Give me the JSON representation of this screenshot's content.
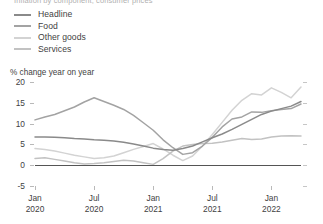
{
  "title": "Inflation by component, consumer prices",
  "legend": {
    "position": "top-left",
    "items": [
      {
        "label": "Headline",
        "color": "#8a8a8a"
      },
      {
        "label": "Food",
        "color": "#a3a3a3"
      },
      {
        "label": "Other goods",
        "color": "#d3d3d3"
      },
      {
        "label": "Services",
        "color": "#c2c2c2"
      }
    ]
  },
  "axis_caption": "% change year on year",
  "colors": {
    "axis": "#b9b9b9",
    "zero_line": "#555555",
    "text": "#3f3f3f",
    "background": "#ffffff"
  },
  "chart_data": {
    "type": "line",
    "title": "Inflation by component, consumer prices",
    "subtitle": "",
    "xlabel": "",
    "ylabel": "% change year on year",
    "ylim": [
      -5,
      20
    ],
    "yticks": [
      20,
      15,
      10,
      5,
      0,
      -5
    ],
    "ytick_labels": [
      "20",
      "15",
      "10",
      "5",
      "0",
      "-5"
    ],
    "grid": false,
    "legend_position": "top-left",
    "x": [
      "Jan 2020",
      "Feb 2020",
      "Mar 2020",
      "Apr 2020",
      "May 2020",
      "Jun 2020",
      "Jul 2020",
      "Aug 2020",
      "Sep 2020",
      "Oct 2020",
      "Nov 2020",
      "Dec 2020",
      "Jan 2021",
      "Feb 2021",
      "Mar 2021",
      "Apr 2021",
      "May 2021",
      "Jun 2021",
      "Jul 2021",
      "Aug 2021",
      "Sep 2021",
      "Oct 2021",
      "Nov 2021",
      "Dec 2021",
      "Jan 2022",
      "Feb 2022",
      "Mar 2022",
      "Apr 2022"
    ],
    "xticks": [
      "Jan 2020",
      "Jul 2020",
      "Jan 2021",
      "Jul 2021",
      "Jan 2022"
    ],
    "xtick_labels": [
      {
        "month": "Jan",
        "year": "2020"
      },
      {
        "month": "Jul",
        "year": "2020"
      },
      {
        "month": "Jan",
        "year": "2021"
      },
      {
        "month": "Jul",
        "year": "2021"
      },
      {
        "month": "Jan",
        "year": "2022"
      }
    ],
    "series": [
      {
        "name": "Headline",
        "color": "#8a8a8a",
        "values": [
          6.8,
          6.8,
          6.7,
          6.6,
          6.4,
          6.3,
          6.1,
          6.0,
          5.8,
          5.5,
          5.1,
          4.6,
          4.1,
          3.8,
          3.6,
          4.0,
          4.6,
          5.6,
          6.6,
          7.5,
          8.6,
          9.8,
          11.0,
          12.2,
          13.0,
          13.6,
          14.2,
          15.3
        ]
      },
      {
        "name": "Food",
        "color": "#a3a3a3",
        "values": [
          10.9,
          11.6,
          12.2,
          13.1,
          14.0,
          15.2,
          16.2,
          15.3,
          14.4,
          13.4,
          12.0,
          10.2,
          8.4,
          6.1,
          4.2,
          2.6,
          3.0,
          4.6,
          6.7,
          9.2,
          11.1,
          11.6,
          12.8,
          12.7,
          13.1,
          13.4,
          13.6,
          14.7
        ]
      },
      {
        "name": "Other goods",
        "color": "#d3d3d3",
        "values": [
          4.0,
          3.8,
          3.4,
          2.9,
          2.4,
          2.0,
          1.6,
          1.8,
          2.2,
          3.0,
          3.8,
          4.5,
          5.2,
          3.9,
          2.4,
          1.1,
          2.2,
          4.6,
          7.4,
          10.3,
          13.2,
          15.6,
          17.2,
          16.9,
          18.6,
          17.5,
          16.2,
          18.8
        ]
      },
      {
        "name": "Services",
        "color": "#c2c2c2",
        "values": [
          1.6,
          1.8,
          1.4,
          1.0,
          0.6,
          0.3,
          0.4,
          0.6,
          0.9,
          1.2,
          1.0,
          0.6,
          0.2,
          1.6,
          3.4,
          4.6,
          5.0,
          5.2,
          5.3,
          5.6,
          6.0,
          6.4,
          6.2,
          6.3,
          6.8,
          7.0,
          7.1,
          7.0
        ]
      }
    ]
  }
}
